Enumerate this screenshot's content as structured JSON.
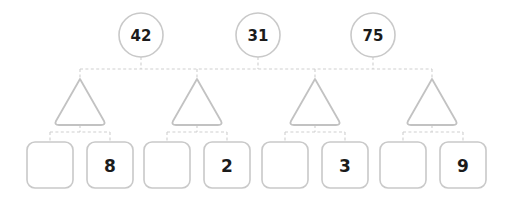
{
  "diagram": {
    "type": "tree",
    "title": "",
    "colors": {
      "stroke": "#c9c9c9",
      "triangle_stroke": "#c2c2c2",
      "connector": "#cfcfcf",
      "text": "#1b1b1b",
      "background": "#ffffff"
    },
    "levels": [
      {
        "name": "root-circles",
        "shape": "circle",
        "nodes": [
          {
            "id": "circle-1",
            "label": "42",
            "cx": 141,
            "cy": 35,
            "r": 22
          },
          {
            "id": "circle-2",
            "label": "31",
            "cx": 258,
            "cy": 35,
            "r": 22
          },
          {
            "id": "circle-3",
            "label": "75",
            "cx": 373,
            "cy": 35,
            "r": 22
          }
        ]
      },
      {
        "name": "middle-triangles",
        "shape": "triangle",
        "nodes": [
          {
            "id": "triangle-1",
            "label": "",
            "cx": 80,
            "cy": 101
          },
          {
            "id": "triangle-2",
            "label": "",
            "cx": 197,
            "cy": 101
          },
          {
            "id": "triangle-3",
            "label": "",
            "cx": 315,
            "cy": 101
          },
          {
            "id": "triangle-4",
            "label": "",
            "cx": 432,
            "cy": 101
          }
        ]
      },
      {
        "name": "leaf-boxes",
        "shape": "rounded-rect",
        "nodes": [
          {
            "id": "box-1",
            "label": "",
            "cx": 50,
            "cy": 165
          },
          {
            "id": "box-2",
            "label": "8",
            "cx": 110,
            "cy": 165
          },
          {
            "id": "box-3",
            "label": "",
            "cx": 167,
            "cy": 165
          },
          {
            "id": "box-4",
            "label": "2",
            "cx": 227,
            "cy": 165
          },
          {
            "id": "box-5",
            "label": "",
            "cx": 285,
            "cy": 165
          },
          {
            "id": "box-6",
            "label": "3",
            "cx": 345,
            "cy": 165
          },
          {
            "id": "box-7",
            "label": "",
            "cx": 403,
            "cy": 165
          },
          {
            "id": "box-8",
            "label": "9",
            "cx": 463,
            "cy": 165
          }
        ]
      }
    ],
    "connector_style": "dashed-orthogonal",
    "bus_y_top": 69,
    "bus_y_sub": 132
  }
}
